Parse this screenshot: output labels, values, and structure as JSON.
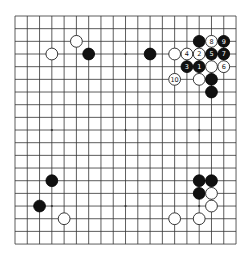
{
  "board": {
    "size": 19,
    "origin_x": 15,
    "origin_y": 16,
    "spacing_x": 12.28,
    "spacing_y": 12.67,
    "stone_radius": 5.9,
    "colors": {
      "background": "#ffffff",
      "line": "#333333",
      "black_stone": "#111111",
      "white_stone": "#ffffff"
    },
    "hoshi": [
      [
        3,
        3
      ],
      [
        9,
        3
      ],
      [
        15,
        3
      ],
      [
        3,
        9
      ],
      [
        9,
        9
      ],
      [
        15,
        9
      ],
      [
        3,
        15
      ],
      [
        9,
        15
      ],
      [
        15,
        15
      ]
    ]
  },
  "stones": [
    {
      "color": "white",
      "col": 5,
      "row": 2,
      "label": ""
    },
    {
      "color": "white",
      "col": 3,
      "row": 3,
      "label": ""
    },
    {
      "color": "black",
      "col": 6,
      "row": 3,
      "label": ""
    },
    {
      "color": "black",
      "col": 11,
      "row": 3,
      "label": ""
    },
    {
      "color": "black",
      "col": 15,
      "row": 2,
      "label": ""
    },
    {
      "color": "white",
      "col": 16,
      "row": 2,
      "label": "8"
    },
    {
      "color": "black",
      "col": 17,
      "row": 2,
      "label": "9"
    },
    {
      "color": "white",
      "col": 13,
      "row": 3,
      "label": ""
    },
    {
      "color": "white",
      "col": 14,
      "row": 3,
      "label": "4"
    },
    {
      "color": "white",
      "col": 15,
      "row": 3,
      "label": "2"
    },
    {
      "color": "black",
      "col": 16,
      "row": 3,
      "label": "5"
    },
    {
      "color": "black",
      "col": 17,
      "row": 3,
      "label": "7"
    },
    {
      "color": "black",
      "col": 14,
      "row": 4,
      "label": "3"
    },
    {
      "color": "black",
      "col": 15,
      "row": 4,
      "label": "1"
    },
    {
      "color": "white",
      "col": 16,
      "row": 4,
      "label": ""
    },
    {
      "color": "white",
      "col": 17,
      "row": 4,
      "label": "6"
    },
    {
      "color": "white",
      "col": 13,
      "row": 5,
      "label": "10"
    },
    {
      "color": "white",
      "col": 15,
      "row": 5,
      "label": ""
    },
    {
      "color": "black",
      "col": 16,
      "row": 5,
      "label": ""
    },
    {
      "color": "black",
      "col": 16,
      "row": 6,
      "label": ""
    },
    {
      "color": "black",
      "col": 3,
      "row": 13,
      "label": ""
    },
    {
      "color": "black",
      "col": 2,
      "row": 15,
      "label": ""
    },
    {
      "color": "white",
      "col": 4,
      "row": 16,
      "label": ""
    },
    {
      "color": "black",
      "col": 15,
      "row": 13,
      "label": ""
    },
    {
      "color": "black",
      "col": 16,
      "row": 13,
      "label": ""
    },
    {
      "color": "black",
      "col": 15,
      "row": 14,
      "label": ""
    },
    {
      "color": "white",
      "col": 16,
      "row": 14,
      "label": ""
    },
    {
      "color": "white",
      "col": 16,
      "row": 15,
      "label": ""
    },
    {
      "color": "white",
      "col": 13,
      "row": 16,
      "label": ""
    },
    {
      "color": "white",
      "col": 15,
      "row": 16,
      "label": ""
    }
  ]
}
